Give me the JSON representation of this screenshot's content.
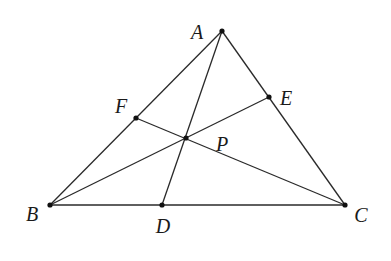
{
  "diagram": {
    "stroke_color": "#2a2a2a",
    "points": {
      "A": {
        "label": "A",
        "x": 222,
        "y": 31,
        "label_x": 197,
        "label_y": 32
      },
      "B": {
        "label": "B",
        "x": 50,
        "y": 205,
        "label_x": 32,
        "label_y": 214
      },
      "C": {
        "label": "C",
        "x": 345,
        "y": 205,
        "label_x": 361,
        "label_y": 215
      },
      "D": {
        "label": "D",
        "x": 162,
        "y": 205,
        "label_x": 163,
        "label_y": 226
      },
      "E": {
        "label": "E",
        "x": 269,
        "y": 97,
        "label_x": 286,
        "label_y": 98
      },
      "F": {
        "label": "F",
        "x": 136,
        "y": 118,
        "label_x": 121,
        "label_y": 106
      },
      "P": {
        "label": "P",
        "x": 186,
        "y": 138,
        "label_x": 222,
        "label_y": 144
      }
    },
    "segments": [
      [
        "A",
        "B"
      ],
      [
        "B",
        "C"
      ],
      [
        "C",
        "A"
      ],
      [
        "A",
        "D"
      ],
      [
        "B",
        "E"
      ],
      [
        "C",
        "F"
      ]
    ]
  }
}
